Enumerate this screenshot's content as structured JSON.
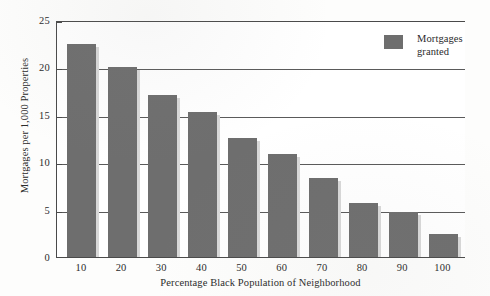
{
  "chart_data": {
    "type": "bar",
    "title": "",
    "xlabel": "Percentage Black Population of Neighborhood",
    "ylabel": "Mortgages per 1,000 Properties",
    "categories": [
      "10",
      "20",
      "30",
      "40",
      "50",
      "60",
      "70",
      "80",
      "90",
      "100"
    ],
    "values": [
      22.5,
      20.0,
      17.1,
      15.3,
      12.6,
      10.9,
      8.35,
      5.7,
      4.75,
      2.4
    ],
    "series": [
      {
        "name": "Mortgages granted",
        "values": [
          22.5,
          20.0,
          17.1,
          15.3,
          12.6,
          10.9,
          8.35,
          5.7,
          4.75,
          2.4
        ],
        "color": "#6e6e6e"
      }
    ],
    "ylim": [
      0,
      25
    ],
    "yticks": [
      "0",
      "5",
      "10",
      "15",
      "20",
      "25"
    ],
    "ytick_values": [
      0,
      5,
      10,
      15,
      20,
      25
    ],
    "grid": true,
    "legend_position": "top-right"
  },
  "legend": {
    "entries": [
      {
        "label": "Mortgages\ngranted",
        "color": "#6e6e6e"
      }
    ]
  },
  "axes": {
    "y_title": "Mortgages per 1,000 Properties",
    "x_title": "Percentage Black Population of Neighborhood"
  },
  "colors": {
    "bar": "#6e6e6e",
    "axis": "#4a4a4a",
    "gridline": "#5a5a5a",
    "background": "#fdfdfc",
    "plot_background": "#ffffff",
    "text": "#2b2b2b"
  }
}
